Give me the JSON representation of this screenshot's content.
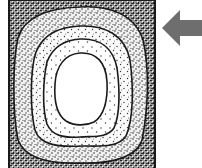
{
  "diagram": {
    "block": {
      "x": 9,
      "y": 0,
      "width": 146,
      "height": 168,
      "border_color": "#1a1a1a"
    },
    "zones": [
      {
        "name": "outer-zone",
        "density": "very-dense",
        "fill": "#6a6a6a"
      },
      {
        "name": "zone-2",
        "density": "dense",
        "fill": "#b8b8b8"
      },
      {
        "name": "zone-3",
        "density": "medium",
        "fill": "#d6d6d6"
      },
      {
        "name": "zone-4",
        "density": "sparse",
        "fill": "#e8e8e8"
      },
      {
        "name": "core",
        "density": "none",
        "fill": "#ffffff"
      }
    ],
    "arrow": {
      "direction": "left",
      "color": "#6e6e6e"
    },
    "colors": {
      "line": "#1a1a1a",
      "background": "#ffffff"
    }
  }
}
